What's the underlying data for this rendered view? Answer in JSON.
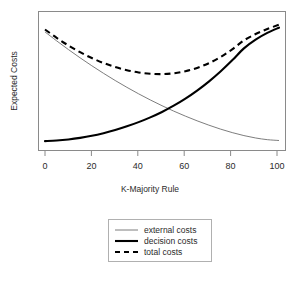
{
  "chart_data": {
    "type": "line",
    "title": "",
    "xlabel": "K-Majority Rule",
    "ylabel": "Expected Costs",
    "xlim": [
      0,
      100
    ],
    "ylim": [
      0,
      1
    ],
    "xticks": [
      0,
      20,
      40,
      60,
      80,
      100
    ],
    "xtick_labels": [
      "0",
      "20",
      "40",
      "60",
      "80",
      "100"
    ],
    "yticks": [],
    "ytick_labels": [],
    "grid": false,
    "legend_position": "below-axes",
    "x": [
      0,
      5,
      10,
      15,
      20,
      25,
      30,
      35,
      40,
      45,
      50,
      55,
      60,
      65,
      70,
      75,
      80,
      85,
      90,
      95,
      100
    ],
    "series": [
      {
        "name": "external costs",
        "style": "thin-solid",
        "color": "#6e6e6e",
        "values": [
          0.93,
          0.855,
          0.783,
          0.714,
          0.648,
          0.585,
          0.525,
          0.468,
          0.414,
          0.363,
          0.315,
          0.27,
          0.228,
          0.189,
          0.153,
          0.12,
          0.091,
          0.066,
          0.046,
          0.032,
          0.025
        ]
      },
      {
        "name": "decision costs",
        "style": "thick-solid",
        "color": "#000000",
        "values": [
          0.02,
          0.025,
          0.034,
          0.047,
          0.064,
          0.086,
          0.112,
          0.143,
          0.178,
          0.218,
          0.263,
          0.315,
          0.374,
          0.441,
          0.516,
          0.6,
          0.693,
          0.793,
          0.866,
          0.922,
          0.965
        ]
      },
      {
        "name": "total costs",
        "style": "thick-dashed",
        "color": "#000000",
        "values": [
          0.95,
          0.88,
          0.817,
          0.761,
          0.712,
          0.671,
          0.637,
          0.611,
          0.592,
          0.581,
          0.578,
          0.585,
          0.602,
          0.63,
          0.669,
          0.72,
          0.784,
          0.859,
          0.912,
          0.954,
          0.99
        ]
      }
    ],
    "annotations": []
  },
  "legend": {
    "entries": [
      {
        "label": "external costs",
        "icon": "thin-line-icon"
      },
      {
        "label": "decision costs",
        "icon": "thick-line-icon"
      },
      {
        "label": "total costs",
        "icon": "dashed-line-icon"
      }
    ]
  }
}
